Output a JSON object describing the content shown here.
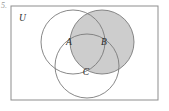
{
  "figure": {
    "kind": "venn-diagram",
    "item_marker": "5.",
    "universe_label": "U",
    "background_color": "#ffffff",
    "border_color": "#8d8d8d",
    "circle_stroke_color": "#7a7a7a",
    "shade_color": "#cdcdcd",
    "label_color": "#2b2b2b",
    "rectangle": {
      "x": 11,
      "y": 6,
      "width": 147,
      "height": 94
    },
    "circles": [
      {
        "id": "A",
        "label": "A",
        "cx": 73,
        "cy": 42,
        "r": 32,
        "shaded": false
      },
      {
        "id": "B",
        "label": "B",
        "cx": 102,
        "cy": 42,
        "r": 32,
        "shaded": true
      },
      {
        "id": "C",
        "label": "C",
        "cx": 87,
        "cy": 66,
        "r": 32,
        "shaded": false
      }
    ],
    "labels": [
      {
        "id": "A",
        "text": "A",
        "x": 69,
        "y": 45
      },
      {
        "id": "B",
        "text": "B",
        "x": 104,
        "y": 45
      },
      {
        "id": "C",
        "text": "C",
        "x": 86,
        "y": 75
      },
      {
        "id": "U",
        "text": "U",
        "x": 19,
        "y": 21
      }
    ],
    "shaded_region_description": "B"
  }
}
